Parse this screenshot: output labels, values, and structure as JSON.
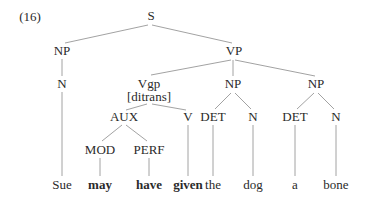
{
  "example_number": "(16)",
  "nodes": {
    "S": {
      "label": "S",
      "x": 151,
      "y": 16
    },
    "NP_subj": {
      "label": "NP",
      "x": 62,
      "y": 51
    },
    "N_subj": {
      "label": "N",
      "x": 62,
      "y": 84
    },
    "VP": {
      "label": "VP",
      "x": 234,
      "y": 51
    },
    "Vgp": {
      "label": "Vgp",
      "x": 149,
      "y": 84
    },
    "Vgp_feature": {
      "label": "[ditrans]",
      "x": 149,
      "y": 97
    },
    "NP_io": {
      "label": "NP",
      "x": 233,
      "y": 84
    },
    "NP_do": {
      "label": "NP",
      "x": 316,
      "y": 84
    },
    "AUX": {
      "label": "AUX",
      "x": 124,
      "y": 117
    },
    "V": {
      "label": "V",
      "x": 188,
      "y": 117
    },
    "DET_io": {
      "label": "DET",
      "x": 213,
      "y": 117
    },
    "N_io": {
      "label": "N",
      "x": 253,
      "y": 117
    },
    "DET_do": {
      "label": "DET",
      "x": 295,
      "y": 117
    },
    "N_do": {
      "label": "N",
      "x": 336,
      "y": 117
    },
    "MOD": {
      "label": "MOD",
      "x": 100,
      "y": 150
    },
    "PERF": {
      "label": "PERF",
      "x": 149,
      "y": 150
    }
  },
  "words": [
    {
      "text": "Sue",
      "x": 62,
      "bold": false
    },
    {
      "text": "may",
      "x": 100,
      "bold": true
    },
    {
      "text": "have",
      "x": 149,
      "bold": true
    },
    {
      "text": "given",
      "x": 188,
      "bold": true
    },
    {
      "text": "the",
      "x": 213,
      "bold": false
    },
    {
      "text": "dog",
      "x": 253,
      "bold": false
    },
    {
      "text": "a",
      "x": 295,
      "bold": false
    },
    {
      "text": "bone",
      "x": 336,
      "bold": false
    }
  ],
  "word_y": 185,
  "edges": [
    [
      "S",
      "NP_subj"
    ],
    [
      "S",
      "VP"
    ],
    [
      "NP_subj",
      "N_subj"
    ],
    [
      "VP",
      "Vgp"
    ],
    [
      "VP",
      "NP_io"
    ],
    [
      "VP",
      "NP_do"
    ],
    [
      "Vgp",
      "AUX"
    ],
    [
      "Vgp",
      "V"
    ],
    [
      "AUX",
      "MOD"
    ],
    [
      "AUX",
      "PERF"
    ],
    [
      "NP_io",
      "DET_io"
    ],
    [
      "NP_io",
      "N_io"
    ],
    [
      "NP_do",
      "DET_do"
    ],
    [
      "NP_do",
      "N_do"
    ]
  ],
  "colors": {
    "line": "#8a8a8a",
    "text": "#2a2a2a"
  }
}
